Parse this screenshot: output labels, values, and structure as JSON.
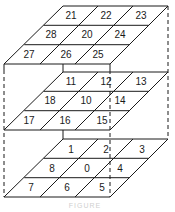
{
  "diagram": {
    "type": "3x3x3 lattice cell numbering (stacked parallelogram layers)",
    "colors": {
      "line": "#1a1a1a",
      "text": "#1a1a1a",
      "background": "#ffffff",
      "caption": "#cfcfcf"
    },
    "layers": [
      {
        "name": "top",
        "rows": [
          [
            "21",
            "22",
            "23"
          ],
          [
            "28",
            "20",
            "24"
          ],
          [
            "27",
            "26",
            "25"
          ]
        ]
      },
      {
        "name": "middle",
        "rows": [
          [
            "11",
            "12",
            "13"
          ],
          [
            "18",
            "10",
            "14"
          ],
          [
            "17",
            "16",
            "15"
          ]
        ]
      },
      {
        "name": "bottom",
        "rows": [
          [
            "1",
            "2",
            "3"
          ],
          [
            "8",
            "0",
            "4"
          ],
          [
            "7",
            "6",
            "5"
          ]
        ]
      }
    ],
    "caption": "FIGURE"
  }
}
